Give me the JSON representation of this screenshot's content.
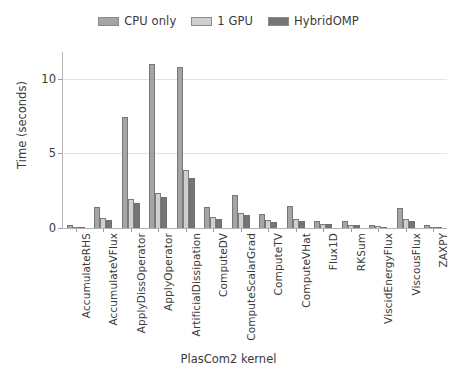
{
  "chart_data": {
    "type": "bar",
    "title": "",
    "xlabel": "PlasCom2 kernel",
    "ylabel": "Time (seconds)",
    "ylim": [
      0,
      11.8
    ],
    "yticks": [
      0,
      5,
      10
    ],
    "ytick_labels": [
      "0",
      "5",
      "10"
    ],
    "grid": true,
    "legend_position": "top-center",
    "categories": [
      "AccumulateRHS",
      "AccumulateVFlux",
      "ApplyDissOperator",
      "ApplyOperator",
      "ArtificialDissipation",
      "ComputeDV",
      "ComputeScalarGrad",
      "ComputeTV",
      "ComputeVHat",
      "Flux1D",
      "RKSum",
      "ViscidEnergyFlux",
      "ViscousFlux",
      "ZAXPY"
    ],
    "series": [
      {
        "name": "CPU only",
        "color": "#a5a5a5",
        "values": [
          0.22,
          1.4,
          7.45,
          11.0,
          10.8,
          1.4,
          2.2,
          0.95,
          1.45,
          0.45,
          0.45,
          0.22,
          1.32,
          0.18
        ]
      },
      {
        "name": "1 GPU",
        "color": "#cfcfcf",
        "values": [
          0.1,
          0.68,
          1.95,
          2.35,
          3.9,
          0.72,
          1.02,
          0.52,
          0.62,
          0.3,
          0.22,
          0.12,
          0.62,
          0.09
        ]
      },
      {
        "name": "HybridOMP",
        "color": "#757575",
        "values": [
          0.09,
          0.57,
          1.65,
          2.05,
          3.38,
          0.6,
          0.85,
          0.42,
          0.5,
          0.24,
          0.17,
          0.1,
          0.5,
          0.07
        ]
      }
    ]
  },
  "legend": {
    "entries": [
      {
        "label": "CPU only"
      },
      {
        "label": "1 GPU"
      },
      {
        "label": "HybridOMP"
      }
    ]
  },
  "axes": {
    "y_title": "Time (seconds)",
    "x_title": "PlasCom2 kernel"
  }
}
